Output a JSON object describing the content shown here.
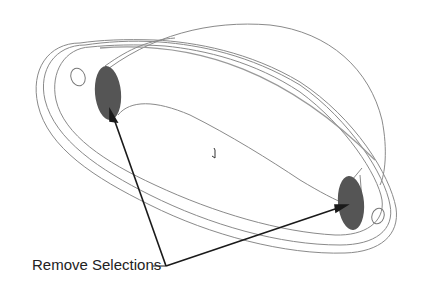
{
  "diagram": {
    "callout_label": "Remove Selections",
    "colors": {
      "outline": "#8a8a8a",
      "selected_face": "#555555",
      "arrow": "#1a1a1a",
      "background": "#ffffff"
    },
    "selections": [
      {
        "name": "left-selected-face",
        "cx": 108,
        "cy": 93,
        "rx": 13,
        "ry": 27
      },
      {
        "name": "right-selected-face",
        "cx": 351,
        "cy": 203,
        "rx": 13,
        "ry": 27
      }
    ]
  }
}
